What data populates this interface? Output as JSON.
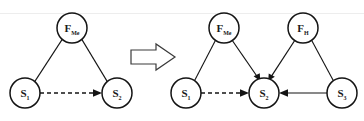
{
  "figure": {
    "background_color": "#ffffff",
    "stroke_color": "#141414",
    "width": 364,
    "height": 121
  },
  "transform_symbol": {
    "glyph": "=>",
    "name": "implies-arrow",
    "label": "implies"
  },
  "left_graph": {
    "name": "before-graph",
    "nodes": [
      {
        "id": "F_Me",
        "base": "F",
        "sub": "Me",
        "cx": 72,
        "cy": 28,
        "r": 15
      },
      {
        "id": "S1",
        "base": "S",
        "sub": "1",
        "cx": 25,
        "cy": 93,
        "r": 15
      },
      {
        "id": "S2",
        "base": "S",
        "sub": "2",
        "cx": 117,
        "cy": 93,
        "r": 15
      }
    ],
    "edges": [
      {
        "from": "F_Me",
        "to": "S1",
        "style": "plain",
        "arrow": false
      },
      {
        "from": "F_Me",
        "to": "S2",
        "style": "plain",
        "arrow": false
      },
      {
        "from": "S1",
        "to": "S2",
        "style": "dashed",
        "arrow": true
      }
    ]
  },
  "right_graph": {
    "name": "after-graph",
    "nodes": [
      {
        "id": "F_Me",
        "base": "F",
        "sub": "Me",
        "cx": 224,
        "cy": 28,
        "r": 15
      },
      {
        "id": "F_H",
        "base": "F",
        "sub": "H",
        "cx": 303,
        "cy": 28,
        "r": 15
      },
      {
        "id": "S1",
        "base": "S",
        "sub": "1",
        "cx": 186,
        "cy": 93,
        "r": 15
      },
      {
        "id": "S2",
        "base": "S",
        "sub": "2",
        "cx": 264,
        "cy": 93,
        "r": 15
      },
      {
        "id": "S3",
        "base": "S",
        "sub": "3",
        "cx": 342,
        "cy": 93,
        "r": 15
      }
    ],
    "edges": [
      {
        "from": "F_Me",
        "to": "S1",
        "style": "plain",
        "arrow": false
      },
      {
        "from": "F_Me",
        "to": "S2",
        "style": "plain",
        "arrow": true
      },
      {
        "from": "F_H",
        "to": "S2",
        "style": "plain",
        "arrow": true
      },
      {
        "from": "F_H",
        "to": "S3",
        "style": "plain",
        "arrow": false
      },
      {
        "from": "S1",
        "to": "S2",
        "style": "dashed",
        "arrow": true
      },
      {
        "from": "S3",
        "to": "S2",
        "style": "solid",
        "arrow": true
      }
    ]
  }
}
